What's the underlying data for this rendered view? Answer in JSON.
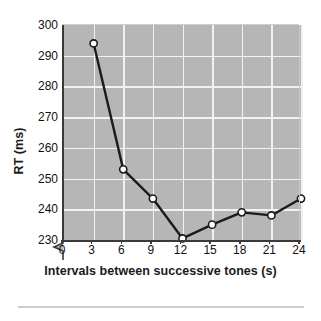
{
  "chart_data": {
    "type": "line",
    "title": "",
    "xlabel": "Intervals between successive tones (s)",
    "ylabel": "RT (ms)",
    "x": [
      3,
      6,
      9,
      12,
      15,
      18,
      21,
      24
    ],
    "values": [
      294,
      253,
      243.5,
      230.5,
      235,
      239,
      238,
      243.5
    ],
    "series": [
      {
        "name": "RT",
        "x": [
          3,
          6,
          9,
          12,
          15,
          18,
          21,
          24
        ],
        "values": [
          294,
          253,
          243.5,
          230.5,
          235,
          239,
          238,
          243.5
        ]
      }
    ],
    "xlim": [
      0,
      24
    ],
    "ylim": [
      230,
      300
    ],
    "xticks": [
      0,
      3,
      6,
      9,
      12,
      15,
      18,
      21,
      24
    ],
    "yticks": [
      230,
      240,
      250,
      260,
      270,
      280,
      290,
      300
    ],
    "xtick_labels": [
      "0",
      "3",
      "6",
      "9",
      "12",
      "15",
      "18",
      "21",
      "24"
    ],
    "ytick_labels": [
      "230",
      "240",
      "250",
      "260",
      "270",
      "280",
      "290",
      "300"
    ],
    "grid": true,
    "legend": "none",
    "axis_break_y": true,
    "marker": "circle-open",
    "colors": {
      "plot_background": "#b6b6b6",
      "gridline": "#f2f2f2",
      "line": "#1b1b1b",
      "marker_fill": "#ffffff",
      "marker_edge": "#1b1b1b",
      "axis": "#3a3a3a",
      "text": "#111111",
      "figure_background": "#ffffff",
      "footer_rule": "#cdcdcd"
    }
  },
  "figure": {
    "y_axis_title": "RT (ms)",
    "x_axis_title": "Intervals between successive tones (s)",
    "y_ticks": [
      {
        "label": "300",
        "value": 300
      },
      {
        "label": "290",
        "value": 290
      },
      {
        "label": "280",
        "value": 280
      },
      {
        "label": "270",
        "value": 270
      },
      {
        "label": "260",
        "value": 260
      },
      {
        "label": "250",
        "value": 250
      },
      {
        "label": "240",
        "value": 240
      },
      {
        "label": "230",
        "value": 230
      }
    ],
    "x_ticks": [
      {
        "label": "0",
        "value": 0
      },
      {
        "label": "3",
        "value": 3
      },
      {
        "label": "6",
        "value": 6
      },
      {
        "label": "9",
        "value": 9
      },
      {
        "label": "12",
        "value": 12
      },
      {
        "label": "15",
        "value": 15
      },
      {
        "label": "18",
        "value": 18
      },
      {
        "label": "21",
        "value": 21
      },
      {
        "label": "24",
        "value": 24
      }
    ]
  }
}
